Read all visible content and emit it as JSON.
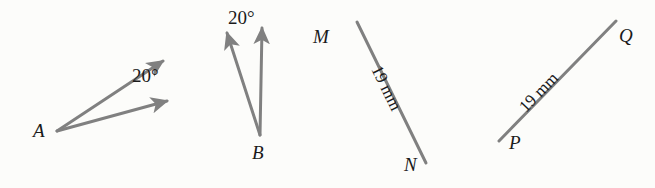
{
  "figure": {
    "background_color": "#fcfcfa",
    "stroke_color": "#808080",
    "text_color": "#1a1a1a",
    "width": 655,
    "height": 188,
    "parts": [
      {
        "id": "angle-a",
        "type": "angle",
        "vertex_label": "A",
        "measure_label": "20°"
      },
      {
        "id": "angle-b",
        "type": "angle",
        "vertex_label": "B",
        "measure_label": "20°"
      },
      {
        "id": "segment-mn",
        "type": "segment",
        "start_label": "M",
        "end_label": "N",
        "length_label": "19 mm"
      },
      {
        "id": "segment-pq",
        "type": "segment",
        "start_label": "P",
        "end_label": "Q",
        "length_label": "19 mm"
      }
    ]
  },
  "labels": {
    "A": "A",
    "B": "B",
    "M": "M",
    "N": "N",
    "P": "P",
    "Q": "Q",
    "angle_a": "20°",
    "angle_b": "20°",
    "length_mn": "19 mm",
    "length_pq": "19 mm"
  }
}
